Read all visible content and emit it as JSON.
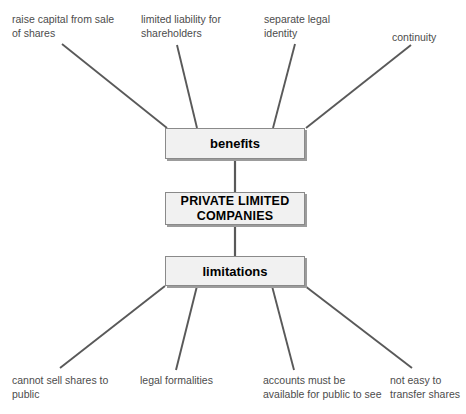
{
  "diagram": {
    "type": "spider-diagram",
    "colors": {
      "box_fill": "#f1f1f1",
      "box_border": "#8a8a8a",
      "box_shadow": "#9c9c9c",
      "connector_line": "#595959",
      "leaf_text": "#4c4c4c",
      "node_text": "#000000",
      "background": "#ffffff"
    },
    "central_node": {
      "label": "PRIVATE LIMITED\nCOMPANIES"
    },
    "branches": [
      {
        "label": "benefits",
        "position": "above-center",
        "leaves": [
          {
            "label": "raise capital from sale\nof shares"
          },
          {
            "label": "limited liability for\nshareholders"
          },
          {
            "label": "separate legal\nidentity"
          },
          {
            "label": "continuity"
          }
        ]
      },
      {
        "label": "limitations",
        "position": "below-center",
        "leaves": [
          {
            "label": "cannot sell shares to\npublic"
          },
          {
            "label": "legal formalities"
          },
          {
            "label": "accounts must be\navailable for public to see"
          },
          {
            "label": "not easy to\ntransfer shares"
          }
        ]
      }
    ]
  }
}
